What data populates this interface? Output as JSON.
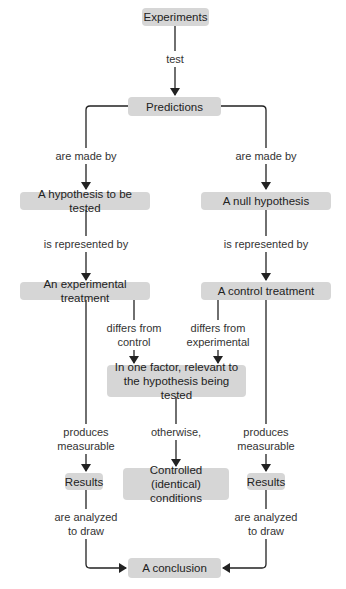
{
  "diagram": {
    "colors": {
      "node_fill": "#d6d6d6",
      "line": "#222222",
      "text": "#222222"
    },
    "nodes": {
      "experiments": "Experiments",
      "predictions": "Predictions",
      "hypothesis": "A hypothesis to be tested",
      "null_hypothesis": "A null hypothesis",
      "experimental_treatment": "An experimental treatment",
      "control_treatment": "A control treatment",
      "one_factor_line1": "In one factor, relevant to",
      "one_factor_line2": "the hypothesis being tested",
      "controlled_line1": "Controlled (identical)",
      "controlled_line2": "conditions",
      "results_left": "Results",
      "results_right": "Results",
      "conclusion": "A conclusion"
    },
    "edges": {
      "test": "test",
      "made_by_left": "are made by",
      "made_by_right": "are made by",
      "represented_left": "is represented by",
      "represented_right": "is represented by",
      "differs_control_1": "differs from",
      "differs_control_2": "control",
      "differs_exp_1": "differs from",
      "differs_exp_2": "experimental",
      "produces_left_1": "produces",
      "produces_left_2": "measurable",
      "otherwise": "otherwise,",
      "produces_right_1": "produces",
      "produces_right_2": "measurable",
      "analyzed_left_1": "are analyzed",
      "analyzed_left_2": "to draw",
      "analyzed_right_1": "are analyzed",
      "analyzed_right_2": "to draw"
    }
  }
}
